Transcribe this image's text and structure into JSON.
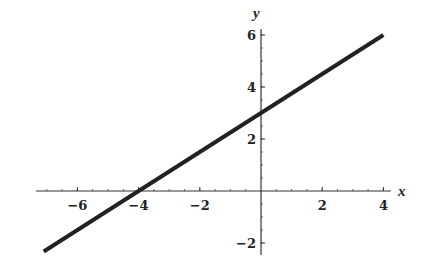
{
  "chart_data": {
    "type": "line",
    "title": "",
    "xlabel": "x",
    "ylabel": "y",
    "xlim": [
      -7.2,
      4.2
    ],
    "ylim": [
      -2.4,
      6.2
    ],
    "x_ticks": [
      -6,
      -4,
      -2,
      2,
      4
    ],
    "x_tick_labels": [
      "−6",
      "−4",
      "−2",
      "2",
      "4"
    ],
    "y_ticks": [
      -2,
      2,
      4,
      6
    ],
    "y_tick_labels": [
      "−2",
      "2",
      "4",
      "6"
    ],
    "grid": false,
    "legend": null,
    "series": [
      {
        "name": "y = 0.75x + 3",
        "equation": "y = (3/4)x + 3",
        "x": [
          -7.1,
          -4,
          0,
          4
        ],
        "y": [
          -2.325,
          0,
          3,
          6
        ],
        "color": "#222222"
      }
    ],
    "annotations": {
      "x_intercept": -4,
      "y_intercept": 3
    }
  },
  "colors": {
    "axis": "#333333",
    "line": "#222222",
    "background": "#ffffff"
  }
}
